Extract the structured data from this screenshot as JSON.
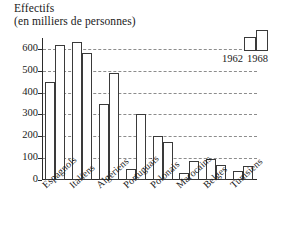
{
  "chart_data": {
    "type": "bar",
    "title": "Effectifs",
    "subtitle": "(en milliers de personnes)",
    "xlabel": "",
    "ylabel": "",
    "ylim": [
      0,
      650
    ],
    "yticks": [
      0,
      100,
      200,
      300,
      400,
      500,
      600
    ],
    "ytick_labels": [
      "0",
      "100",
      "200",
      "300",
      "400",
      "500",
      "600"
    ],
    "grid": true,
    "grid_style": "dashed horizontal",
    "legend_position": "top-right",
    "categories": [
      "Espagnols",
      "Italiens",
      "Algériens",
      "Portuguais",
      "Polonais",
      "Marocains",
      "Belges",
      "Tunisiens"
    ],
    "series": [
      {
        "name": "1962",
        "values": [
          450,
          630,
          350,
          50,
          200,
          33,
          95,
          40
        ]
      },
      {
        "name": "1968",
        "values": [
          620,
          580,
          490,
          300,
          175,
          85,
          70,
          65
        ]
      }
    ]
  },
  "legend": {
    "entries": [
      "1962",
      "1968"
    ]
  }
}
